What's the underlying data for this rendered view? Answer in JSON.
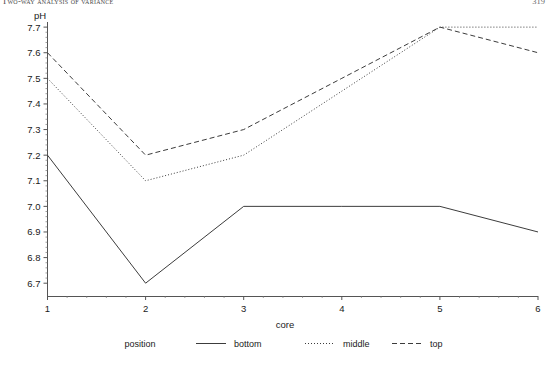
{
  "page_header": {
    "running_title": "Two-way analysis of variance",
    "page_number": "319"
  },
  "figure": {
    "y_axis_title": "pH",
    "x_axis_title": "core",
    "legend_title": "position"
  },
  "chart_data": {
    "type": "line",
    "title": "",
    "xlabel": "core",
    "ylabel": "pH",
    "x": [
      1,
      2,
      3,
      4,
      5,
      6
    ],
    "xtick_labels": [
      "1",
      "2",
      "3",
      "4",
      "5",
      "6"
    ],
    "xlim": [
      1,
      6
    ],
    "ytick_labels": [
      "6.7",
      "6.8",
      "6.9",
      "7.0",
      "7.1",
      "7.2",
      "7.3",
      "7.4",
      "7.5",
      "7.6",
      "7.7"
    ],
    "ytick_values": [
      6.7,
      6.8,
      6.9,
      7.0,
      7.1,
      7.2,
      7.3,
      7.4,
      7.5,
      7.6,
      7.7
    ],
    "ylim": [
      6.65,
      7.72
    ],
    "grid": false,
    "legend_position": "bottom",
    "legend_title": "position",
    "series": [
      {
        "name": "bottom",
        "linestyle": "solid",
        "color": "#3c3c3c",
        "values": [
          7.2,
          6.7,
          7.0,
          7.0,
          7.0,
          6.9
        ]
      },
      {
        "name": "middle",
        "linestyle": "dotted",
        "color": "#3c3c3c",
        "values": [
          7.5,
          7.1,
          7.2,
          7.45,
          7.7,
          7.7
        ]
      },
      {
        "name": "top",
        "linestyle": "dashed",
        "color": "#3c3c3c",
        "values": [
          7.6,
          7.2,
          7.3,
          7.5,
          7.7,
          7.6
        ]
      }
    ]
  }
}
